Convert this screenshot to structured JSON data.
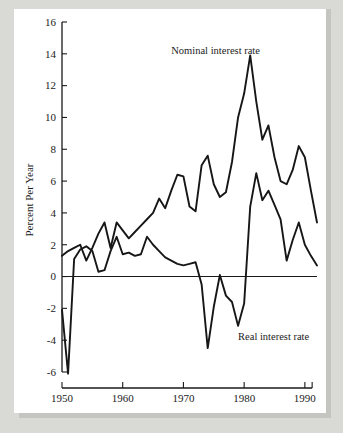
{
  "figure": {
    "background_color": "#d9d9d6",
    "paper_color": "#ffffff",
    "line_color": "#161616"
  },
  "labels": {
    "ylabel": "Percent Per Year",
    "nominal_label": "Nominal interest rate",
    "real_label": "Real interest rate"
  },
  "chart_data": {
    "type": "line",
    "title": "",
    "xlabel": "",
    "ylabel": "Percent Per Year",
    "xlim": [
      1950,
      1992
    ],
    "ylim": [
      -6,
      16
    ],
    "yticks": [
      -6,
      -4,
      -2,
      0,
      2,
      4,
      6,
      8,
      10,
      12,
      14,
      16
    ],
    "ytick_labels": [
      "-6",
      "-4",
      "-2",
      "0",
      "2",
      "4",
      "6",
      "8",
      "10",
      "12",
      "14",
      "16"
    ],
    "xticks": [
      1950,
      1960,
      1970,
      1980,
      1990
    ],
    "xtick_labels": [
      "1950",
      "1960",
      "1970",
      "1980",
      "1990"
    ],
    "grid": false,
    "legend": "inline-annotation",
    "zero_line": true,
    "x": [
      1950,
      1951,
      1952,
      1953,
      1954,
      1955,
      1956,
      1957,
      1958,
      1959,
      1960,
      1961,
      1962,
      1963,
      1964,
      1965,
      1966,
      1967,
      1968,
      1969,
      1970,
      1971,
      1972,
      1973,
      1974,
      1975,
      1976,
      1977,
      1978,
      1979,
      1980,
      1981,
      1982,
      1983,
      1984,
      1985,
      1986,
      1987,
      1988,
      1989,
      1990,
      1991,
      1992
    ],
    "series": [
      {
        "name": "Nominal interest rate",
        "values": [
          1.3,
          1.6,
          1.8,
          2.0,
          1.0,
          1.8,
          2.7,
          3.4,
          1.8,
          3.4,
          2.9,
          2.4,
          2.8,
          3.2,
          3.6,
          4.0,
          4.9,
          4.3,
          5.4,
          6.4,
          6.3,
          4.4,
          4.1,
          7.0,
          7.6,
          5.8,
          5.0,
          5.3,
          7.2,
          10.0,
          11.5,
          13.9,
          11.0,
          8.6,
          9.5,
          7.5,
          6.0,
          5.8,
          6.7,
          8.2,
          7.5,
          5.4,
          3.4
        ]
      },
      {
        "name": "Real interest rate",
        "values": [
          -2.1,
          -6.1,
          1.1,
          1.7,
          1.9,
          1.6,
          0.3,
          0.4,
          1.6,
          2.5,
          1.4,
          1.5,
          1.3,
          1.4,
          2.5,
          2.0,
          1.6,
          1.2,
          1.0,
          0.8,
          0.7,
          0.8,
          0.9,
          -0.5,
          -4.5,
          -1.9,
          0.1,
          -1.2,
          -1.6,
          -3.1,
          -1.7,
          4.4,
          6.5,
          4.8,
          5.4,
          4.5,
          3.6,
          1.0,
          2.3,
          3.4,
          2.0,
          1.3,
          0.7
        ]
      }
    ],
    "annotations": [
      {
        "text": "Nominal interest rate",
        "x": 1968,
        "y": 14.0
      },
      {
        "text": "Real interest rate",
        "x": 1979,
        "y": -4.0
      }
    ]
  }
}
